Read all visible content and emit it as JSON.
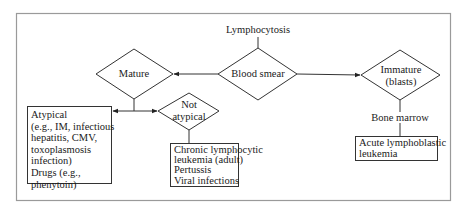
{
  "diagram": {
    "title": "Lymphocytosis",
    "nodes": {
      "blood_smear": {
        "label": "Blood smear",
        "shape": "diamond"
      },
      "mature": {
        "label": "Mature",
        "shape": "diamond"
      },
      "immature": {
        "label_line1": "Immature",
        "label_line2": "(blasts)",
        "shape": "diamond"
      },
      "not_atypical": {
        "label_line1": "Not",
        "label_line2": "atypical",
        "shape": "diamond"
      },
      "bone_marrow": {
        "label": "Bone marrow"
      }
    },
    "boxes": {
      "atypical": {
        "lines": [
          "Atypical",
          "(e.g., IM, infectious",
          "hepatitis, CMV,",
          "toxoplasmosis",
          "infection)",
          "Drugs (e.g.,",
          "phenytoin)"
        ]
      },
      "not_atypical_causes": {
        "lines": [
          "Chronic lymphocytic",
          "leukemia (adult)",
          "Pertussis",
          "Viral infections"
        ]
      },
      "immature_result": {
        "lines": [
          "Acute lymphoblastic",
          "leukemia"
        ]
      }
    },
    "edges": [
      {
        "from": "Lymphocytosis",
        "to": "Blood smear"
      },
      {
        "from": "Blood smear",
        "to": "Mature",
        "arrow": true
      },
      {
        "from": "Blood smear",
        "to": "Immature (blasts)",
        "arrow": true
      },
      {
        "from": "Mature",
        "to": "Atypical",
        "arrow": true
      },
      {
        "from": "Mature",
        "to": "Not atypical",
        "arrow": true
      },
      {
        "from": "Not atypical",
        "to": "Chronic lymphocytic leukemia (adult) / Pertussis / Viral infections"
      },
      {
        "from": "Immature (blasts)",
        "to": "Acute lymphoblastic leukemia",
        "via": "Bone marrow"
      }
    ],
    "colors": {
      "line": "#333333",
      "frame": "#9a9a9a",
      "background": "#ffffff"
    }
  }
}
